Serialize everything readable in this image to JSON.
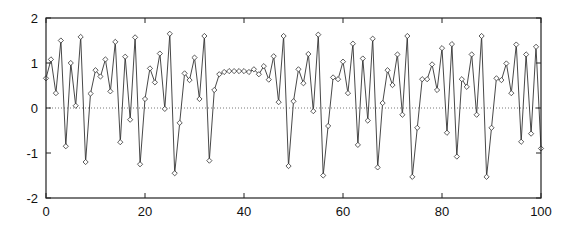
{
  "chart_data": {
    "type": "line",
    "title": "",
    "xlabel": "",
    "ylabel": "",
    "xlim": [
      0,
      100
    ],
    "ylim": [
      -2,
      2
    ],
    "x_ticks": [
      0,
      20,
      40,
      60,
      80,
      100
    ],
    "y_ticks": [
      -2,
      -1,
      0,
      1,
      2
    ],
    "x_tick_labels": [
      "0",
      "20",
      "40",
      "60",
      "80",
      "100"
    ],
    "y_tick_labels": [
      "-2",
      "-1",
      "0",
      "1",
      "2"
    ],
    "grid": false,
    "legend": null,
    "reference_line": {
      "y": 0,
      "style": "dotted"
    },
    "marker": "diamond",
    "series": [
      {
        "name": "series",
        "x": [
          0,
          1,
          2,
          3,
          4,
          5,
          6,
          7,
          8,
          9,
          10,
          11,
          12,
          13,
          14,
          15,
          16,
          17,
          18,
          19,
          20,
          21,
          22,
          23,
          24,
          25,
          26,
          27,
          28,
          29,
          30,
          31,
          32,
          33,
          34,
          35,
          36,
          37,
          38,
          39,
          40,
          41,
          42,
          43,
          44,
          45,
          46,
          47,
          48,
          49,
          50,
          51,
          52,
          53,
          54,
          55,
          56,
          57,
          58,
          59,
          60,
          61,
          62,
          63,
          64,
          65,
          66,
          67,
          68,
          69,
          70,
          71,
          72,
          73,
          74,
          75,
          76,
          77,
          78,
          79,
          80,
          81,
          82,
          83,
          84,
          85,
          86,
          87,
          88,
          89,
          90,
          91,
          92,
          93,
          94,
          95,
          96,
          97,
          98,
          99,
          100
        ],
        "values": [
          0.66,
          1.08,
          0.33,
          1.5,
          -0.85,
          1.0,
          0.05,
          1.58,
          -1.2,
          0.32,
          0.84,
          0.7,
          1.08,
          0.37,
          1.47,
          -0.76,
          1.14,
          -0.26,
          1.57,
          -1.25,
          0.2,
          0.88,
          0.57,
          1.21,
          -0.02,
          1.65,
          -1.45,
          -0.33,
          0.77,
          0.62,
          1.12,
          0.2,
          1.6,
          -1.17,
          0.4,
          0.75,
          0.8,
          0.82,
          0.82,
          0.82,
          0.82,
          0.8,
          0.86,
          0.75,
          0.93,
          0.63,
          1.15,
          0.13,
          1.6,
          -1.29,
          0.15,
          0.86,
          0.55,
          1.2,
          -0.07,
          1.63,
          -1.5,
          -0.4,
          0.68,
          0.64,
          1.03,
          0.33,
          1.43,
          -0.82,
          1.1,
          -0.28,
          1.54,
          -1.32,
          0.11,
          0.84,
          0.51,
          1.19,
          -0.15,
          1.6,
          -1.53,
          -0.44,
          0.64,
          0.64,
          0.97,
          0.4,
          1.33,
          -0.55,
          1.42,
          -1.08,
          0.64,
          0.47,
          1.19,
          -0.15,
          1.6,
          -1.53,
          -0.44,
          0.66,
          0.62,
          0.99,
          0.33,
          1.41,
          -0.75,
          1.19,
          -0.57,
          1.36,
          -0.9
        ]
      }
    ]
  },
  "colors": {
    "line": "#333333",
    "marker_stroke": "#333333",
    "marker_fill": "#ffffff",
    "axes": "#222222",
    "zero_line": "#555555"
  }
}
